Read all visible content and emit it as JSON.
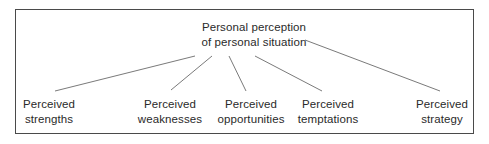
{
  "diagram": {
    "type": "tree",
    "root": {
      "line1": "Personal perception",
      "line2": "of personal situation"
    },
    "children": [
      {
        "line1": "Perceived",
        "line2": "strengths"
      },
      {
        "line1": "Perceived",
        "line2": "weaknesses"
      },
      {
        "line1": "Perceived",
        "line2": "opportunities"
      },
      {
        "line1": "Perceived",
        "line2": "temptations"
      },
      {
        "line1": "Perceived",
        "line2": "strategy"
      }
    ],
    "colors": {
      "border": "#4a4a4a",
      "line": "#7a7a7a",
      "text": "#2a2a2a"
    }
  }
}
